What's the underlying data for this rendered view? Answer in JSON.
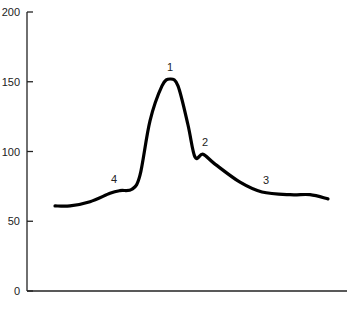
{
  "chart_data": {
    "type": "line",
    "title": "",
    "xlabel": "",
    "ylabel": "",
    "ylim": [
      0,
      200
    ],
    "yticks": [
      0,
      50,
      100,
      150,
      200
    ],
    "grid": false,
    "legend": null,
    "series": [
      {
        "name": "curve",
        "x": [
          55,
          70,
          90,
          110,
          120,
          132,
          140,
          150,
          162,
          170,
          178,
          188,
          195,
          203,
          215,
          240,
          262,
          290,
          310,
          328
        ],
        "values": [
          61,
          61,
          64,
          70,
          72,
          73,
          83,
          122,
          147,
          152,
          147,
          119,
          96,
          98,
          91,
          78,
          71,
          69,
          69,
          66
        ]
      }
    ],
    "annotations": [
      {
        "label": "1",
        "x": 170,
        "y": 152
      },
      {
        "label": "2",
        "x": 205,
        "y": 98
      },
      {
        "label": "3",
        "x": 266,
        "y": 71
      },
      {
        "label": "4",
        "x": 114,
        "y": 72
      }
    ]
  }
}
